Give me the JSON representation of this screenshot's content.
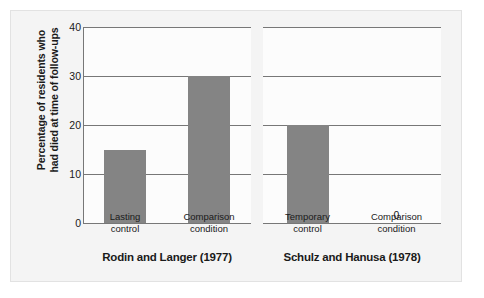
{
  "chart_data": {
    "type": "bar",
    "title": "",
    "subtitle": "",
    "xlabel": "",
    "ylabel_lines": [
      "Percentage of residents who",
      "had died at time of follow-ups"
    ],
    "ylabel": "Percentage of residents who had died at time of follow-ups",
    "ylim": [
      0,
      40
    ],
    "yticks": [
      0,
      10,
      20,
      30,
      40
    ],
    "ytick_labels": [
      "0",
      "10",
      "20",
      "30",
      "40"
    ],
    "grid": true,
    "grid_axis": "y",
    "legend": "none",
    "bar_color": "#848484",
    "panels": [
      {
        "title": "Rodin and Langer (1977)",
        "categories": [
          "Lasting control",
          "Comparison condition"
        ],
        "category_lines": [
          [
            "Lasting",
            "control"
          ],
          [
            "Comparison",
            "condition"
          ]
        ],
        "values": [
          15,
          30
        ],
        "value_labels": [
          "",
          ""
        ]
      },
      {
        "title": "Schulz and Hanusa (1978)",
        "categories": [
          "Temporary control",
          "Comparison condition"
        ],
        "category_lines": [
          [
            "Temporary",
            "control"
          ],
          [
            "Comparison",
            "condition"
          ]
        ],
        "values": [
          20,
          0
        ],
        "value_labels": [
          "",
          "0"
        ]
      }
    ]
  },
  "axis": {
    "tick_0": "0",
    "tick_1": "10",
    "tick_2": "20",
    "tick_3": "30",
    "tick_4": "40",
    "ylabel_line_1": "Percentage of residents who",
    "ylabel_line_2": "had died at time of follow-ups"
  },
  "panel_0": {
    "title": "Rodin and Langer (1977)",
    "cat_0_line_1": "Lasting",
    "cat_0_line_2": "control",
    "cat_1_line_1": "Comparison",
    "cat_1_line_2": "condition"
  },
  "panel_1": {
    "title": "Schulz and Hanusa (1978)",
    "cat_0_line_1": "Temporary",
    "cat_0_line_2": "control",
    "cat_1_line_1": "Comparison",
    "cat_1_line_2": "condition",
    "zero_value_label": "0"
  },
  "colors": {
    "bar": "#848484",
    "gridline": "#777777",
    "figure_background": "#f4f4f4",
    "plot_background": "#fcfcfc",
    "text": "#1a1a1a"
  }
}
